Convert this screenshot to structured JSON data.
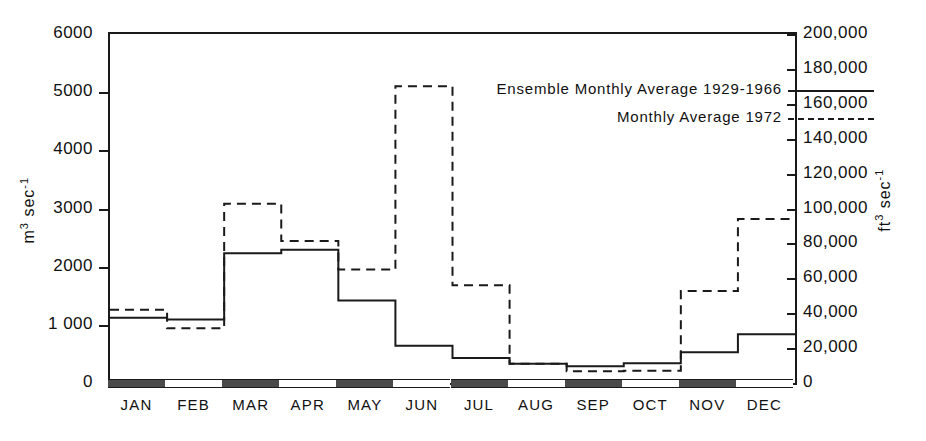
{
  "chart_data": {
    "type": "line",
    "title": "",
    "xlabel": "",
    "ylabel": "m3 sec-1",
    "ylabel_right": "ft3 sec-1",
    "categories": [
      "JAN",
      "FEB",
      "MAR",
      "APR",
      "MAY",
      "JUN",
      "JUL",
      "AUG",
      "SEP",
      "OCT",
      "NOV",
      "DEC"
    ],
    "ylim": [
      0,
      6000
    ],
    "ylim_right": [
      0,
      200000
    ],
    "grid": false,
    "legend_position": "top-right",
    "step_style": "histogram",
    "series": [
      {
        "name": "Ensemble Monthly Average 1929-1966",
        "style": "solid",
        "values": [
          1120,
          1090,
          2230,
          2290,
          1420,
          640,
          430,
          330,
          290,
          340,
          530,
          840
        ]
      },
      {
        "name": "Monthly Average 1972",
        "style": "dashed",
        "values": [
          1260,
          940,
          3080,
          2440,
          1950,
          5100,
          1680,
          330,
          200,
          210,
          1580,
          2820
        ]
      }
    ],
    "y_ticks_left": [
      {
        "value": 0,
        "label": "0"
      },
      {
        "value": 1000,
        "label": "1 000"
      },
      {
        "value": 2000,
        "label": "2000"
      },
      {
        "value": 3000,
        "label": "3000"
      },
      {
        "value": 4000,
        "label": "4000"
      },
      {
        "value": 5000,
        "label": "5000"
      },
      {
        "value": 6000,
        "label": "6000"
      }
    ],
    "y_ticks_right": [
      {
        "value": 0,
        "label": "0"
      },
      {
        "value": 20000,
        "label": "20,000"
      },
      {
        "value": 40000,
        "label": "40,000"
      },
      {
        "value": 60000,
        "label": "60,000"
      },
      {
        "value": 80000,
        "label": "80,000"
      },
      {
        "value": 100000,
        "label": "100,000"
      },
      {
        "value": 120000,
        "label": "120,000"
      },
      {
        "value": 140000,
        "label": "140,000"
      },
      {
        "value": 160000,
        "label": "160,000"
      },
      {
        "value": 180000,
        "label": "180,000"
      },
      {
        "value": 200000,
        "label": "200,000"
      }
    ]
  },
  "axes": {
    "left_title_base": "m",
    "left_title_sup1": "3",
    "left_title_mid": " sec",
    "left_title_sup2": "-1",
    "right_title_base": "ft",
    "right_title_sup1": "3",
    "right_title_mid": " sec",
    "right_title_sup2": "-1"
  },
  "legend": {
    "entries": [
      {
        "label": "Ensemble Monthly Average 1929-1966",
        "style": "solid"
      },
      {
        "label": "Monthly Average 1972",
        "style": "dashed"
      }
    ]
  },
  "colors": {
    "ink": "#1a1a1a",
    "band_dark": "#4a4a4a",
    "band_light": "#ffffff",
    "background": "#ffffff"
  }
}
